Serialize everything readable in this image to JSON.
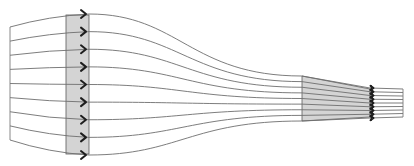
{
  "diagram": {
    "streamline_count": 9,
    "regions": [
      {
        "name": "inlet-cross-section",
        "description": "wide cross-section (shaded)"
      },
      {
        "name": "outlet-cross-section",
        "description": "narrow cross-section (shaded)"
      }
    ],
    "flow_direction": "left-to-right",
    "colors": {
      "band_fill": "#d4d4d4",
      "streamline": "#6e6e6e",
      "arrow": "#1e1e1e",
      "background": "#ffffff"
    }
  }
}
